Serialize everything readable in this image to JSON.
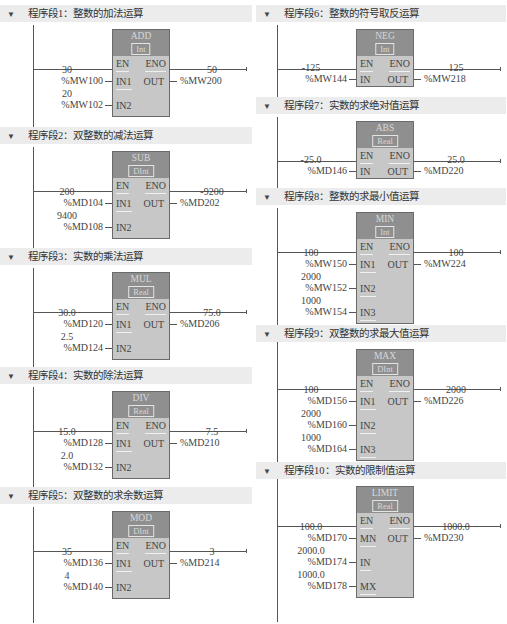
{
  "networks": [
    {
      "title": "程序段1：整数的加法运算",
      "instr": "ADD",
      "type": "Int",
      "inputs": [
        {
          "pin": "IN1",
          "value": "30",
          "addr": "%MW100"
        },
        {
          "pin": "IN2",
          "value": "20",
          "addr": "%MW102"
        }
      ],
      "output": {
        "pin": "OUT",
        "value": "50",
        "addr": "%MW200"
      }
    },
    {
      "title": "程序段2：双整数的减法运算",
      "instr": "SUB",
      "type": "DInt",
      "inputs": [
        {
          "pin": "IN1",
          "value": "200",
          "addr": "%MD104"
        },
        {
          "pin": "IN2",
          "value": "9400",
          "addr": "%MD108"
        }
      ],
      "output": {
        "pin": "OUT",
        "value": "-9200",
        "addr": "%MD202"
      }
    },
    {
      "title": "程序段3：实数的乘法运算",
      "instr": "MUL",
      "type": "Real",
      "inputs": [
        {
          "pin": "IN1",
          "value": "30.0",
          "addr": "%MD120"
        },
        {
          "pin": "IN2",
          "value": "2.5",
          "addr": "%MD124"
        }
      ],
      "output": {
        "pin": "OUT",
        "value": "75.0",
        "addr": "%MD206"
      }
    },
    {
      "title": "程序段4：实数的除法运算",
      "instr": "DIV",
      "type": "Real",
      "inputs": [
        {
          "pin": "IN1",
          "value": "15.0",
          "addr": "%MD128"
        },
        {
          "pin": "IN2",
          "value": "2.0",
          "addr": "%MD132"
        }
      ],
      "output": {
        "pin": "OUT",
        "value": "7.5",
        "addr": "%MD210"
      }
    },
    {
      "title": "程序段5：双整数的求余数运算",
      "instr": "MOD",
      "type": "DInt",
      "inputs": [
        {
          "pin": "IN1",
          "value": "35",
          "addr": "%MD136"
        },
        {
          "pin": "IN2",
          "value": "4",
          "addr": "%MD140"
        }
      ],
      "output": {
        "pin": "OUT",
        "value": "3",
        "addr": "%MD214"
      }
    },
    {
      "title": "程序段6：整数的符号取反运算",
      "instr": "NEG",
      "type": "Int",
      "inputs": [
        {
          "pin": "IN",
          "value": "-125",
          "addr": "%MW144"
        }
      ],
      "output": {
        "pin": "OUT",
        "value": "125",
        "addr": "%MW218"
      }
    },
    {
      "title": "程序段7：实数的求绝对值运算",
      "instr": "ABS",
      "type": "Real",
      "inputs": [
        {
          "pin": "IN",
          "value": "-25.0",
          "addr": "%MD146"
        }
      ],
      "output": {
        "pin": "OUT",
        "value": "25.0",
        "addr": "%MD220"
      }
    },
    {
      "title": "程序段8：整数的求最小值运算",
      "instr": "MIN",
      "type": "Int",
      "inputs": [
        {
          "pin": "IN1",
          "value": "100",
          "addr": "%MW150"
        },
        {
          "pin": "IN2",
          "value": "2000",
          "addr": "%MW152"
        },
        {
          "pin": "IN3",
          "value": "1000",
          "addr": "%MW154"
        }
      ],
      "output": {
        "pin": "OUT",
        "value": "100",
        "addr": "%MW224"
      }
    },
    {
      "title": "程序段9：双整数的求最大值运算",
      "instr": "MAX",
      "type": "DInt",
      "inputs": [
        {
          "pin": "IN1",
          "value": "100",
          "addr": "%MD156"
        },
        {
          "pin": "IN2",
          "value": "2000",
          "addr": "%MD160"
        },
        {
          "pin": "IN3",
          "value": "1000",
          "addr": "%MD164"
        }
      ],
      "output": {
        "pin": "OUT",
        "value": "2000",
        "addr": "%MD226"
      }
    },
    {
      "title": "程序段10：实数的限制值运算",
      "instr": "LIMIT",
      "type": "Real",
      "inputs": [
        {
          "pin": "MN",
          "value": "100.0",
          "addr": "%MD170"
        },
        {
          "pin": "IN",
          "value": "2000.0",
          "addr": "%MD174"
        },
        {
          "pin": "MX",
          "value": "1000.0",
          "addr": "%MD178"
        }
      ],
      "output": {
        "pin": "OUT",
        "value": "1000.0",
        "addr": "%MD230"
      }
    }
  ],
  "pins": {
    "en": "EN",
    "eno": "ENO"
  },
  "colors": {
    "header_bg": "#ececec",
    "box_body": "#c7c7c7",
    "box_head": "#8f8f8f",
    "wire": "#555555"
  }
}
